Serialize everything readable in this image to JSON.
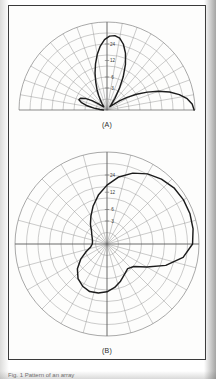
{
  "figure": {
    "page_background": "#ffffff",
    "frame_border_color": "#3a3a3a",
    "pattern_color": "#1c1c1c",
    "grid_color": "#8e8e8e",
    "caption_a": "(A)",
    "caption_b": "(B)",
    "footer_text": "Fig. 1 Pattern of an array",
    "radial_labels": [
      "3",
      "6",
      "12",
      "24"
    ]
  },
  "chart_data": [
    {
      "type": "line",
      "plot_style": "polar",
      "id": "plot-a",
      "title": "(A)",
      "angular_range_deg": [
        0,
        180
      ],
      "angular_gridline_step_deg": 10,
      "radial_tick_labels": [
        "3",
        "6",
        "12",
        "24"
      ],
      "radial_tick_fractions": [
        0.25,
        0.375,
        0.5625,
        0.75
      ],
      "radial_rings": 8,
      "grid": true,
      "legend": "none",
      "theta_deg": [
        0,
        4,
        8,
        12,
        16,
        20,
        24,
        28,
        32,
        36,
        40,
        44,
        48,
        52,
        56,
        60,
        64,
        68,
        72,
        76,
        80,
        84,
        88,
        92,
        96,
        100,
        104,
        108,
        112,
        116,
        120,
        124,
        128,
        132,
        136,
        140,
        144,
        148,
        152,
        156,
        160,
        164,
        168,
        172,
        176,
        180
      ],
      "r_normalized": [
        0.99,
        0.97,
        0.92,
        0.84,
        0.74,
        0.62,
        0.5,
        0.38,
        0.27,
        0.18,
        0.11,
        0.07,
        0.05,
        0.08,
        0.16,
        0.28,
        0.42,
        0.56,
        0.68,
        0.77,
        0.83,
        0.85,
        0.84,
        0.8,
        0.73,
        0.64,
        0.54,
        0.44,
        0.34,
        0.26,
        0.19,
        0.13,
        0.09,
        0.06,
        0.05,
        0.07,
        0.12,
        0.2,
        0.28,
        0.33,
        0.34,
        0.3,
        0.23,
        0.15,
        0.08,
        0.04
      ],
      "description": "Multi-lobe array radiation pattern, major lobe near 0 deg, secondary lobe near 84 deg, minor lobe near 160 deg"
    },
    {
      "type": "line",
      "plot_style": "polar",
      "id": "plot-b",
      "title": "(B)",
      "angular_range_deg": [
        0,
        360
      ],
      "angular_gridline_step_deg": 15,
      "radial_tick_labels": [
        "3",
        "6",
        "12",
        "24"
      ],
      "radial_tick_fractions": [
        0.25,
        0.375,
        0.5625,
        0.75
      ],
      "radial_rings": 8,
      "grid": true,
      "legend": "none",
      "theta_deg": [
        0,
        10,
        20,
        30,
        40,
        50,
        60,
        70,
        80,
        90,
        100,
        110,
        120,
        130,
        140,
        150,
        160,
        170,
        180,
        190,
        200,
        210,
        220,
        230,
        240,
        250,
        260,
        270,
        280,
        290,
        300,
        310,
        320,
        330,
        340,
        350,
        360
      ],
      "r_normalized": [
        0.93,
        0.95,
        0.96,
        0.96,
        0.95,
        0.92,
        0.88,
        0.82,
        0.74,
        0.64,
        0.54,
        0.44,
        0.35,
        0.28,
        0.22,
        0.19,
        0.17,
        0.16,
        0.16,
        0.18,
        0.24,
        0.33,
        0.42,
        0.49,
        0.53,
        0.55,
        0.54,
        0.52,
        0.48,
        0.43,
        0.38,
        0.35,
        0.38,
        0.5,
        0.68,
        0.84,
        0.93
      ],
      "description": "Cardioid-like single main lobe pattern pointing upward with small rear lobe"
    }
  ]
}
